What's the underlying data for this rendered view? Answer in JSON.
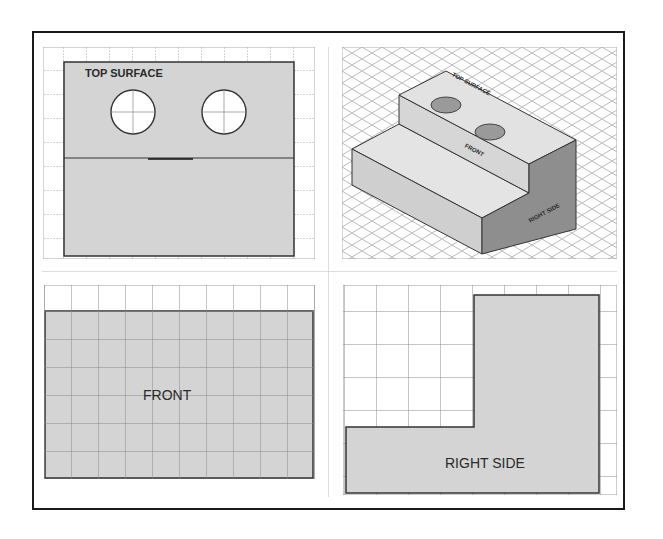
{
  "figure": {
    "panels": [
      {
        "id": "top-view",
        "label": "TOP SURFACE",
        "position": "top-left"
      },
      {
        "id": "isometric-view",
        "labels": [
          "TOP SURFACE",
          "FRONT",
          "RIGHT SIDE"
        ],
        "position": "top-right"
      },
      {
        "id": "front-view",
        "label": "FRONT",
        "position": "bottom-left"
      },
      {
        "id": "right-side-view",
        "label": "RIGHT SIDE",
        "position": "bottom-right"
      }
    ]
  },
  "top_view": {
    "label": "TOP SURFACE",
    "holes": 2
  },
  "isometric_view": {
    "top_label": "TOP SURFACE",
    "front_label": "FRONT",
    "side_label": "RIGHT SIDE"
  },
  "front_view": {
    "label": "FRONT"
  },
  "right_side_view": {
    "label": "RIGHT SIDE"
  },
  "colors": {
    "face_fill": "#d4d4d4",
    "grid_line": "#9a9a9a",
    "outline": "#333333",
    "frame": "#1a1a1a"
  }
}
